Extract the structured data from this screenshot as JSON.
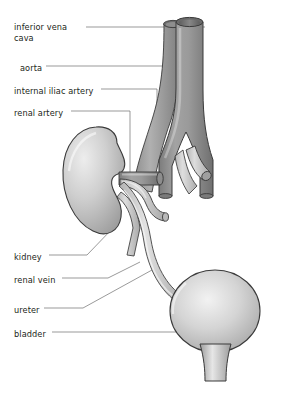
{
  "figure": {
    "background": "#ffffff",
    "palette": {
      "vessel_dark": "#8a8a8a",
      "vessel_mid": "#9a9a9a",
      "vessel_light": "#c9c9c9",
      "organ_light": "#e8e8e8",
      "organ_mid": "#b5b5b5",
      "outline": "#3a3a3a",
      "leader_line": "#6f6f6f",
      "text": "#231f20"
    }
  },
  "labels": [
    {
      "id": "inferior-vena-cava",
      "text": "inferior vena cava",
      "x": 14,
      "y": 22,
      "wrap": true
    },
    {
      "id": "aorta",
      "text": "aorta",
      "x": 20,
      "y": 63,
      "wrap": false
    },
    {
      "id": "internal-iliac-artery",
      "text": "internal iliac artery",
      "x": 14,
      "y": 86,
      "wrap": false
    },
    {
      "id": "renal-artery",
      "text": "renal artery",
      "x": 14,
      "y": 108,
      "wrap": false
    },
    {
      "id": "kidney",
      "text": "kidney",
      "x": 14,
      "y": 252,
      "wrap": false
    },
    {
      "id": "renal-vein",
      "text": "renal vein",
      "x": 14,
      "y": 275,
      "wrap": false
    },
    {
      "id": "ureter",
      "text": "ureter",
      "x": 14,
      "y": 305,
      "wrap": false
    },
    {
      "id": "bladder",
      "text": "bladder",
      "x": 14,
      "y": 329,
      "wrap": false
    }
  ],
  "structures": [
    {
      "id": "inferior-vena-cava",
      "name": "inferior vena cava",
      "kind": "vein"
    },
    {
      "id": "aorta",
      "name": "aorta",
      "kind": "artery"
    },
    {
      "id": "internal-iliac-artery",
      "name": "internal iliac artery",
      "kind": "artery"
    },
    {
      "id": "renal-artery",
      "name": "renal artery",
      "kind": "artery"
    },
    {
      "id": "renal-vein",
      "name": "renal vein",
      "kind": "vein"
    },
    {
      "id": "kidney",
      "name": "kidney",
      "kind": "organ"
    },
    {
      "id": "ureter",
      "name": "ureter",
      "kind": "duct"
    },
    {
      "id": "bladder",
      "name": "bladder",
      "kind": "organ"
    },
    {
      "id": "urethra",
      "name": "urethra",
      "kind": "duct"
    }
  ]
}
